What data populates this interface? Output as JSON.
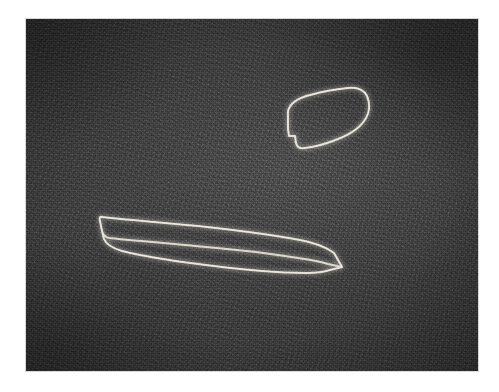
{
  "figure": {
    "kind": "grayscale-imaging-frame",
    "caption": "",
    "canvas": {
      "width": 499,
      "height": 392
    },
    "margin_color": "#ffffff",
    "plate": {
      "x": 26,
      "y": 19,
      "width": 452,
      "height": 352,
      "background_color": "#3e3e3e",
      "border_color": "#d8d8d8",
      "texture": "film-grain-speckle",
      "tone_range": {
        "min": "#2f2f2f",
        "max": "#4d4d4d"
      }
    },
    "contour_color": "#ded9cf",
    "objects": [
      {
        "id": "object-upper",
        "label": "",
        "shape": "rounded-elongated-blob",
        "orientation_degrees": -18,
        "bounds": {
          "x": 262,
          "y": 73,
          "width": 82,
          "height": 58
        },
        "feature": "small notch on lower-left edge",
        "outline_brightness": "high"
      },
      {
        "id": "object-lower",
        "label": "",
        "shape": "long-tapered-spindle",
        "orientation_degrees": -8,
        "bounds": {
          "x": 74,
          "y": 193,
          "width": 250,
          "height": 60
        },
        "feature": "blunt left terminus, sharp pointed right tip",
        "outline_brightness": "high"
      }
    ]
  }
}
